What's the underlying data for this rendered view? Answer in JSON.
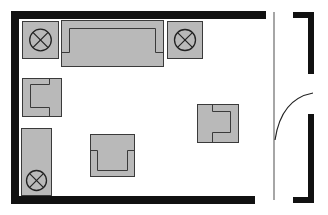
{
  "diagram": {
    "type": "floor-plan",
    "colors": {
      "wall": "#111111",
      "furniture_fill": "#b9b9b9",
      "furniture_stroke": "#3a3a3a",
      "door_line": "#888888",
      "door_arc": "#222222",
      "background": "#ffffff"
    },
    "walls": [
      {
        "name": "top-wall",
        "x": 11,
        "y": 11,
        "w": 255,
        "h": 8
      },
      {
        "name": "left-wall",
        "x": 11,
        "y": 11,
        "w": 8,
        "h": 193
      },
      {
        "name": "bottom-wall",
        "x": 11,
        "y": 196,
        "w": 244,
        "h": 8
      },
      {
        "name": "right-top-wall-cap",
        "x": 293,
        "y": 12,
        "w": 21,
        "h": 6
      },
      {
        "name": "right-top-wall",
        "x": 308,
        "y": 12,
        "w": 6,
        "h": 62
      },
      {
        "name": "right-bottom-wall",
        "x": 308,
        "y": 114,
        "w": 6,
        "h": 89
      },
      {
        "name": "right-bottom-wall-cap",
        "x": 293,
        "y": 197,
        "w": 21,
        "h": 6
      }
    ],
    "door": {
      "leaf": {
        "x1": 274,
        "y1": 12,
        "x2": 274,
        "y2": 200
      },
      "swing_arc": {
        "from": [
          275,
          140
        ],
        "to": [
          313,
          93
        ]
      }
    },
    "furniture": [
      {
        "name": "end-table-top-left",
        "kind": "end-table-lamp",
        "x": 22,
        "y": 21,
        "w": 36,
        "h": 37
      },
      {
        "name": "sofa",
        "kind": "sofa",
        "x": 61,
        "y": 20,
        "w": 102,
        "h": 46
      },
      {
        "name": "end-table-top-right",
        "kind": "end-table-lamp",
        "x": 167,
        "y": 21,
        "w": 35,
        "h": 37
      },
      {
        "name": "armchair-left",
        "kind": "armchair-back-left",
        "x": 22,
        "y": 78,
        "w": 39,
        "h": 38
      },
      {
        "name": "cabinet-lamp-bottom-left",
        "kind": "cabinet-lamp",
        "x": 21,
        "y": 128,
        "w": 30,
        "h": 67
      },
      {
        "name": "armchair-bottom",
        "kind": "armchair-back-bottom",
        "x": 90,
        "y": 134,
        "w": 44,
        "h": 42
      },
      {
        "name": "armchair-right",
        "kind": "armchair-back-right",
        "x": 197,
        "y": 104,
        "w": 41,
        "h": 38
      }
    ]
  }
}
